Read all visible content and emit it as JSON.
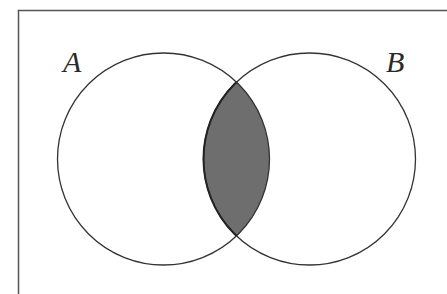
{
  "diagram": {
    "type": "venn",
    "title": "",
    "sets": [
      {
        "name": "A",
        "label": "A"
      },
      {
        "name": "B",
        "label": "B"
      }
    ],
    "shaded_region": "A ∩ B",
    "colors": {
      "outline": "#333333",
      "shade": "#6e6e6e",
      "background": "#ffffff",
      "frame": "#555555"
    }
  }
}
